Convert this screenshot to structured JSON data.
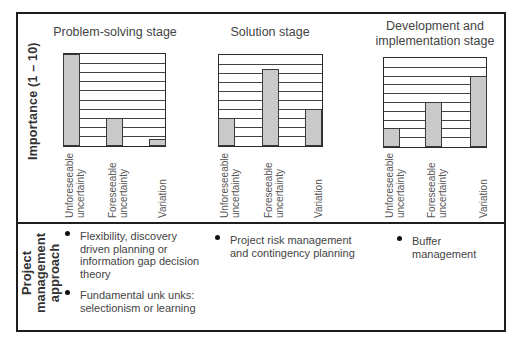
{
  "ylabel": "Importance  (1 – 10)",
  "chart_data": [
    {
      "type": "bar",
      "title": "Problem-solving stage",
      "categories": [
        "Unforeseeable uncertainty",
        "Foreseeable uncertainty",
        "Variation"
      ],
      "values": [
        10,
        3,
        0.7
      ],
      "ylabel": "Importance (1 – 10)",
      "ylim": [
        0,
        10
      ],
      "grid": true
    },
    {
      "type": "bar",
      "title": "Solution stage",
      "categories": [
        "Unforeseeable uncertainty",
        "Foreseeable uncertainty",
        "Variation"
      ],
      "values": [
        3,
        8.5,
        4
      ],
      "ylabel": "Importance (1 – 10)",
      "ylim": [
        0,
        10
      ],
      "grid": true
    },
    {
      "type": "bar",
      "title": "Development and implementation stage",
      "title_lines": [
        "Development and",
        "implementation stage"
      ],
      "categories": [
        "Unforeseeable uncertainty",
        "Foreseeable uncertainty",
        "Variation"
      ],
      "values": [
        2,
        5,
        8
      ],
      "ylabel": "Importance (1 – 10)",
      "ylim": [
        0,
        10
      ],
      "grid": true
    }
  ],
  "categories_split": [
    [
      "Unforeseeable",
      "uncertainty"
    ],
    [
      "Foreseeable",
      "uncertainty"
    ],
    [
      "Variation"
    ]
  ],
  "approach": {
    "label_lines": [
      "Project",
      "management",
      "approach"
    ],
    "columns": [
      {
        "items": [
          [
            "Flexibility, discovery",
            "driven planning or",
            "information gap decision",
            "theory"
          ],
          [
            "Fundamental unk unks:",
            "selectionism or learning"
          ]
        ]
      },
      {
        "items": [
          [
            "Project risk management",
            "and contingency planning"
          ]
        ]
      },
      {
        "items": [
          [
            "Buffer",
            "management"
          ]
        ]
      }
    ]
  },
  "colors": {
    "bar_fill": "#c9c9c9",
    "frame": "#1e1e1e",
    "text": "#444444"
  }
}
